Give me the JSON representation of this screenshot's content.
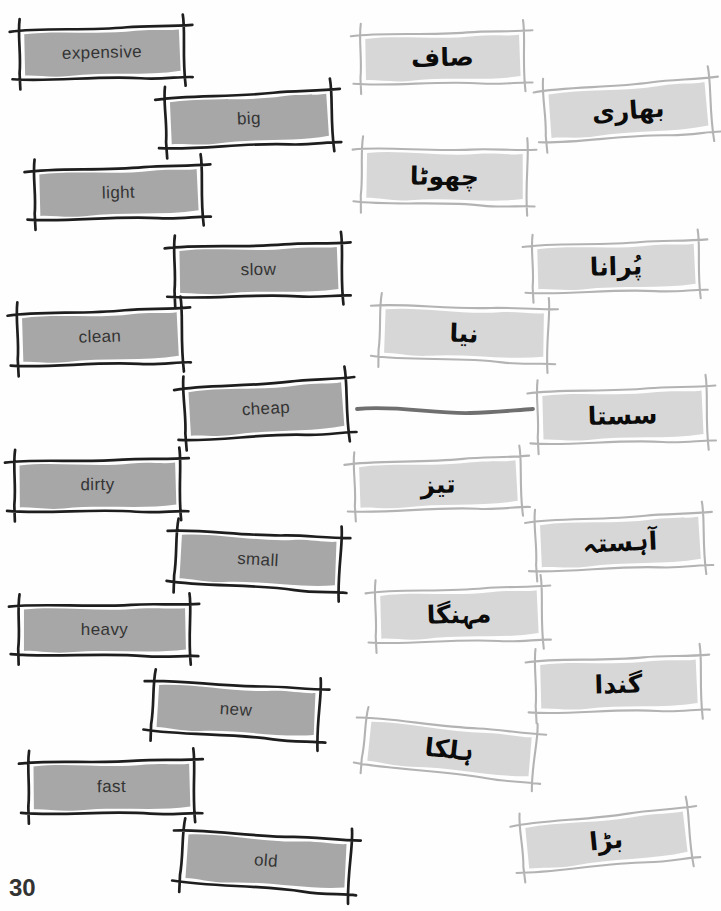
{
  "page_number": "30",
  "exercise": {
    "type": "matching-word-cards",
    "left_language": "English",
    "right_language": "Urdu"
  },
  "english_words": [
    "expensive",
    "big",
    "light",
    "slow",
    "clean",
    "cheap",
    "dirty",
    "small",
    "heavy",
    "new",
    "fast",
    "old"
  ],
  "urdu_words": [
    "صاف",
    "بھاری",
    "چھوٹا",
    "پُرانا",
    "نیا",
    "سستا",
    "تیز",
    "آہستہ",
    "مہنگا",
    "گندا",
    "ہلکا",
    "بڑا"
  ],
  "match_line": {
    "from_word": "cheap",
    "to_word": "سستا"
  },
  "colors": {
    "english_card_fill": "#a7a7a7",
    "english_card_border": "#1e1e1e",
    "urdu_card_fill": "#d7d7d7",
    "urdu_card_border": "#b3b3b3",
    "connector_line": "#6f6f6f",
    "page_number_text": "#333333"
  }
}
